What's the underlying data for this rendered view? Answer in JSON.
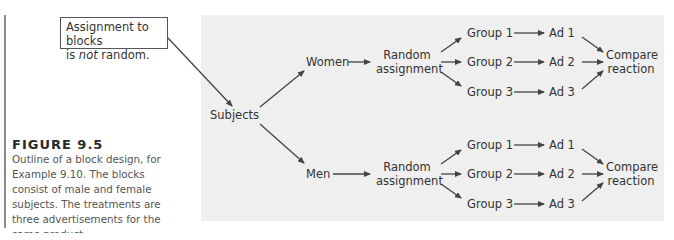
{
  "callout": {
    "line1": "Assignment to blocks",
    "line2_prefix": "is ",
    "line2_emph": "not",
    "line2_suffix": " random."
  },
  "figure": {
    "title": "FIGURE 9.5",
    "caption": "Outline of a block design, for Example 9.10. The blocks consist of male and female subjects. The treatments are three advertisements for the same product."
  },
  "diagram": {
    "root": "Subjects",
    "blocks": [
      {
        "name": "Women",
        "assignment": [
          "Random",
          "assignment"
        ],
        "groups": [
          "Group 1",
          "Group 2",
          "Group 3"
        ],
        "treatments": [
          "Ad 1",
          "Ad 2",
          "Ad 3"
        ],
        "outcome": [
          "Compare",
          "reaction"
        ]
      },
      {
        "name": "Men",
        "assignment": [
          "Random",
          "assignment"
        ],
        "groups": [
          "Group 1",
          "Group 2",
          "Group 3"
        ],
        "treatments": [
          "Ad 1",
          "Ad 2",
          "Ad 3"
        ],
        "outcome": [
          "Compare",
          "reaction"
        ]
      }
    ]
  },
  "colors": {
    "panel": "#efefef",
    "arrow": "#444444",
    "text": "#333333"
  }
}
